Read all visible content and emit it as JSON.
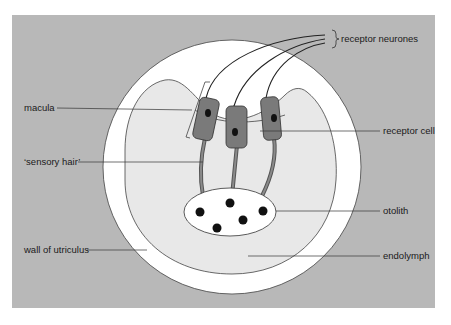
{
  "diagram": {
    "colors": {
      "page": "#ffffff",
      "panel": "#b8b8b8",
      "wall": "#ffffff",
      "endolymph": "#e6e6e6",
      "cell": "#7a7a7a",
      "nucleus": "#111111",
      "otolith": "#ffffff",
      "line": "#333333"
    },
    "labels": {
      "receptor_neurones": "receptor neurones",
      "macula": "macula",
      "receptor_cell": "receptor cell",
      "sensory_hair": "‘sensory hair’",
      "otolith": "otolith",
      "wall_of_utriculus": "wall of utriculus",
      "endolymph": "endolymph"
    }
  }
}
